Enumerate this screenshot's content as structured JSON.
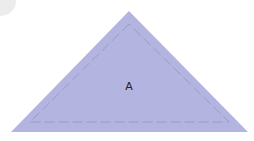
{
  "diagram": {
    "shape": "triangle",
    "label": "A",
    "fill_color": "#b3b5e0",
    "seam_line_color": "#9a9cc8",
    "seam_line_style": "dashed",
    "vertices": [
      [
        129,
        11
      ],
      [
        11,
        132
      ],
      [
        248,
        132
      ]
    ],
    "seam_vertices": [
      [
        129,
        24
      ],
      [
        30,
        122
      ],
      [
        229,
        122
      ]
    ]
  }
}
